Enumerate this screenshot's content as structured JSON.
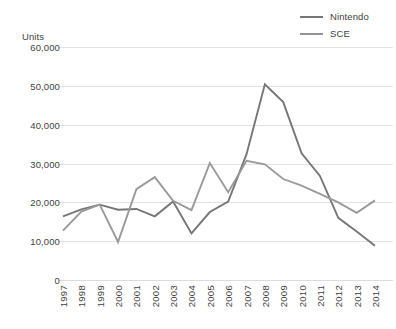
{
  "chart_data": {
    "type": "line",
    "title": "",
    "xlabel": "",
    "ylabel": "Units",
    "ylim": [
      0,
      60000
    ],
    "yticks": [
      "0",
      "10,000",
      "20,000",
      "30,000",
      "40,000",
      "50,000",
      "60,000"
    ],
    "ytick_values": [
      0,
      10000,
      20000,
      30000,
      40000,
      50000,
      60000
    ],
    "grid": true,
    "legend_position": "top-right",
    "categories": [
      "1997",
      "1998",
      "1999",
      "2000",
      "2001",
      "2002",
      "2003",
      "2004",
      "2005",
      "2006",
      "2007",
      "2008",
      "2009",
      "2010",
      "2011",
      "2012",
      "2013",
      "2014"
    ],
    "series": [
      {
        "name": "Nintendo",
        "color": "#767676",
        "values": [
          16400,
          18200,
          19400,
          18100,
          18300,
          16400,
          20200,
          12000,
          17500,
          20200,
          32400,
          50400,
          45800,
          32600,
          26800,
          16000,
          12500,
          8800
        ]
      },
      {
        "name": "SCE",
        "color": "#9a9a9a",
        "values": [
          12700,
          17600,
          19400,
          9800,
          23400,
          26500,
          20400,
          18000,
          30100,
          22600,
          30700,
          29800,
          26000,
          24300,
          22200,
          20000,
          17300,
          20500
        ]
      }
    ]
  },
  "legend": {
    "entries": [
      {
        "label": "Nintendo",
        "icon": "line-swatch-icon"
      },
      {
        "label": "SCE",
        "icon": "line-swatch-icon"
      }
    ]
  },
  "axis": {
    "units_label": "Units"
  }
}
